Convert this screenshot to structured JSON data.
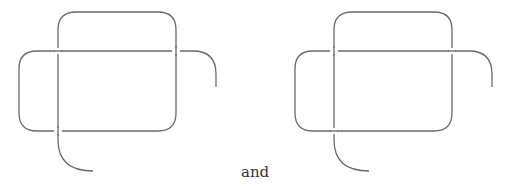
{
  "diagram": {
    "type": "knot-diagram-pair",
    "connector_text": "and",
    "stroke_color": "#6a6a6a",
    "left": {
      "offset_x": 0,
      "crossings": [
        {
          "at": [
            58,
            51
          ],
          "over": "horizontal"
        },
        {
          "at": [
            176,
            51
          ],
          "over": "vertical"
        },
        {
          "at": [
            58,
            131
          ],
          "over": "vertical"
        }
      ]
    },
    "right": {
      "offset_x": 276,
      "crossings": [
        {
          "at": [
            334,
            51
          ],
          "over": "vertical"
        },
        {
          "at": [
            452,
            51
          ],
          "over": "horizontal"
        },
        {
          "at": [
            334,
            131
          ],
          "over": "horizontal"
        }
      ]
    }
  }
}
